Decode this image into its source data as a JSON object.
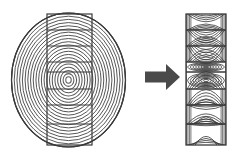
{
  "diagram": {
    "type": "illustration",
    "background_color": "#ffffff",
    "line_color": "#3a3a3a",
    "ring_fill_color": "#cccccc",
    "arrow_color": "#4a4a4a",
    "panels": [
      {
        "id": "log-cross-section",
        "label": "",
        "shape": "ellipse",
        "center": {
          "x": 68.5,
          "y": 80
        },
        "radius_x": 57,
        "radius_y": 67,
        "ring_count": 21,
        "ring_spacing": 2.72,
        "description": "Concentric annual growth rings of a log end-grain"
      },
      {
        "id": "cutting-plane",
        "label": "",
        "shape": "rectangle",
        "x": 47,
        "y": 14,
        "width": 45,
        "height": 131,
        "band_count": 8,
        "description": "Vertical saw-cut plane overlaid on the log, split into eight board bands"
      },
      {
        "id": "board-face-grain",
        "label": "",
        "shape": "rectangle",
        "x": 186,
        "y": 14,
        "width": 40,
        "height": 131,
        "band_count": 8,
        "description": "Resulting plain-sawn board showing cathedral arch and bullseye figure"
      }
    ],
    "arrow": {
      "name": "transform-arrow",
      "direction": "right",
      "x1": 145,
      "x2": 180,
      "y": 77,
      "shaft_thickness": 11,
      "head_width": 14,
      "head_height": 26,
      "color": "#4a4a4a"
    },
    "band_boundaries_y": [
      14,
      30,
      46,
      62,
      72,
      89,
      105,
      124,
      145
    ],
    "bands": [
      {
        "index": 0,
        "pattern": "flat-arc",
        "top": 14,
        "bottom": 30,
        "arc_count": 4,
        "curvature": "low"
      },
      {
        "index": 1,
        "pattern": "arc",
        "top": 30,
        "bottom": 46,
        "arc_count": 5,
        "curvature": "medium"
      },
      {
        "index": 2,
        "pattern": "arc",
        "top": 46,
        "bottom": 62,
        "arc_count": 5,
        "curvature": "high"
      },
      {
        "index": 3,
        "pattern": "bullseye",
        "top": 62,
        "bottom": 72,
        "arc_count": 7,
        "curvature": "closed"
      },
      {
        "index": 4,
        "pattern": "bullseye",
        "top": 72,
        "bottom": 89,
        "arc_count": 7,
        "curvature": "closed"
      },
      {
        "index": 5,
        "pattern": "arc",
        "top": 89,
        "bottom": 105,
        "arc_count": 5,
        "curvature": "high"
      },
      {
        "index": 6,
        "pattern": "arc",
        "top": 105,
        "bottom": 124,
        "arc_count": 5,
        "curvature": "medium"
      },
      {
        "index": 7,
        "pattern": "flat-arc",
        "top": 124,
        "bottom": 145,
        "arc_count": 4,
        "curvature": "low"
      }
    ]
  }
}
